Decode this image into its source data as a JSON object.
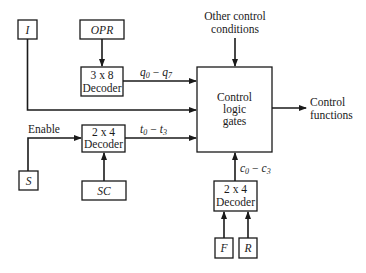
{
  "diagram": {
    "inputs": {
      "i": "I",
      "opr": "OPR",
      "s": "S",
      "sc": "SC",
      "f": "F",
      "r": "R"
    },
    "decoders": {
      "opr_decoder": {
        "size": "3 x 8",
        "label": "Decoder"
      },
      "sc_decoder": {
        "size": "2 x 4",
        "label": "Decoder"
      },
      "fr_decoder": {
        "size": "2 x 4",
        "label": "Decoder"
      }
    },
    "control_block": {
      "line1": "Control",
      "line2": "logic",
      "line3": "gates"
    },
    "signals": {
      "q": {
        "base": "q",
        "from": "0",
        "to": "7",
        "dash": "−"
      },
      "t": {
        "base": "t",
        "from": "0",
        "to": "3",
        "dash": "−"
      },
      "c": {
        "base": "c",
        "from": "0",
        "to": "3",
        "dash": "−"
      }
    },
    "labels": {
      "enable": "Enable",
      "other_line1": "Other control",
      "other_line2": "conditions",
      "output_line1": "Control",
      "output_line2": "functions"
    }
  }
}
